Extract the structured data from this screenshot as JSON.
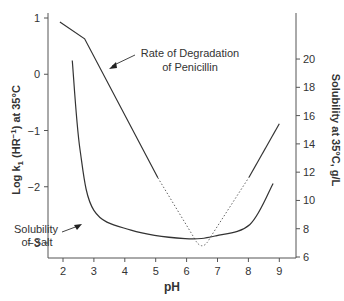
{
  "chart_data": {
    "type": "line",
    "title": "",
    "xlabel": "pH",
    "ylabel_left": "Log k1 (HR-1) at 35°C",
    "ylabel_right": "Solubility at 35°C, g/L",
    "xlim": [
      1.5,
      9.5
    ],
    "ylim_left": [
      -3.25,
      1.1
    ],
    "ylim_right": [
      6,
      22
    ],
    "x_ticks": [
      "2",
      "3",
      "4",
      "5",
      "6",
      "7",
      "8",
      "9"
    ],
    "y_left_ticks": [
      "1",
      "0",
      "−1",
      "−2",
      "−3"
    ],
    "y_right_ticks": [
      "6",
      "8",
      "10",
      "12",
      "14",
      "16",
      "18",
      "20"
    ],
    "grid": false,
    "series": [
      {
        "name": "Rate of Degradation of Penicillin",
        "axis": "left",
        "style": "solid with dotted segment between pH 5.1 and 8.0",
        "x": [
          1.9,
          2.7,
          5.07,
          6.5,
          8.02,
          9.0
        ],
        "y": [
          0.93,
          0.63,
          -1.84,
          -3.12,
          -1.83,
          -0.88
        ]
      },
      {
        "name": "Solubility of Salt",
        "axis": "right",
        "style": "solid",
        "x": [
          2.3,
          2.55,
          3.0,
          4.2,
          5.95,
          6.95,
          8.05,
          8.8
        ],
        "y": [
          19.9,
          13.6,
          9.3,
          7.9,
          7.3,
          7.5,
          8.3,
          11.2
        ]
      }
    ],
    "annotations": [
      {
        "text": "Rate of Degradation",
        "line2": "of Penicillin"
      },
      {
        "text": "Solubility",
        "line2": "of Salt"
      }
    ]
  }
}
